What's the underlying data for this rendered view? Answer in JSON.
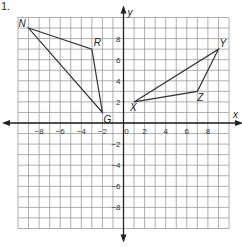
{
  "problem_number": "1.",
  "axes": {
    "x_label": "x",
    "y_label": "y",
    "range": [
      -10,
      10
    ],
    "x_ticks": [
      "-8",
      "-6",
      "-4",
      "-2",
      "0",
      "2",
      "4",
      "6",
      "8"
    ],
    "y_ticks": [
      "8",
      "6",
      "4",
      "2",
      "-2",
      "-4",
      "-6",
      "-8"
    ]
  },
  "shapes": [
    {
      "name": "triangle NRG",
      "vertices": [
        {
          "label": "N",
          "x": -9,
          "y": 9
        },
        {
          "label": "R",
          "x": -3,
          "y": 7
        },
        {
          "label": "G",
          "x": -2,
          "y": 1
        }
      ]
    },
    {
      "name": "triangle XYZ",
      "vertices": [
        {
          "label": "X",
          "x": 1,
          "y": 2
        },
        {
          "label": "Y",
          "x": 9,
          "y": 7
        },
        {
          "label": "Z",
          "x": 7,
          "y": 3
        }
      ]
    }
  ],
  "colors": {
    "grid": "#9a9a9a",
    "axis": "#222222",
    "shape": "#333333"
  }
}
